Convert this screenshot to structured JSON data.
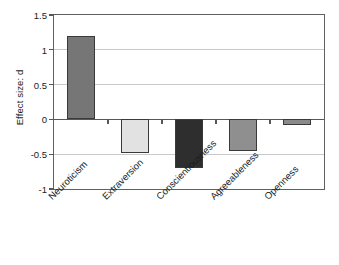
{
  "chart_data": {
    "type": "bar",
    "title": "",
    "xlabel": "",
    "ylabel": "Effect size: d",
    "categories": [
      "Neuroticism",
      "Extraversion",
      "Conscientiousness",
      "Agreeableness",
      "Openness"
    ],
    "values": [
      1.2,
      -0.48,
      -0.7,
      -0.46,
      -0.08
    ],
    "series": [
      {
        "name": "Effect size: d",
        "values": [
          1.2,
          -0.48,
          -0.7,
          -0.46,
          -0.08
        ]
      }
    ],
    "bar_colors": [
      "#767676",
      "#e2e2e2",
      "#2e2e2e",
      "#8f8f8f",
      "#8a8a8a"
    ],
    "bar_edge_color": "#3a3a3a",
    "ylim": [
      -1,
      1.5
    ],
    "yticks": [
      -1,
      -0.5,
      0,
      0.5,
      1,
      1.5
    ],
    "ytick_labels": [
      "-1",
      "-0.5",
      "0",
      "0.5",
      "1",
      "1.5"
    ],
    "grid": "horizontal",
    "legend": "none",
    "zero_line": 0,
    "xtick_label_rotation": -45,
    "frame": "box"
  },
  "axes": {
    "y_title": "Effect size: d"
  }
}
